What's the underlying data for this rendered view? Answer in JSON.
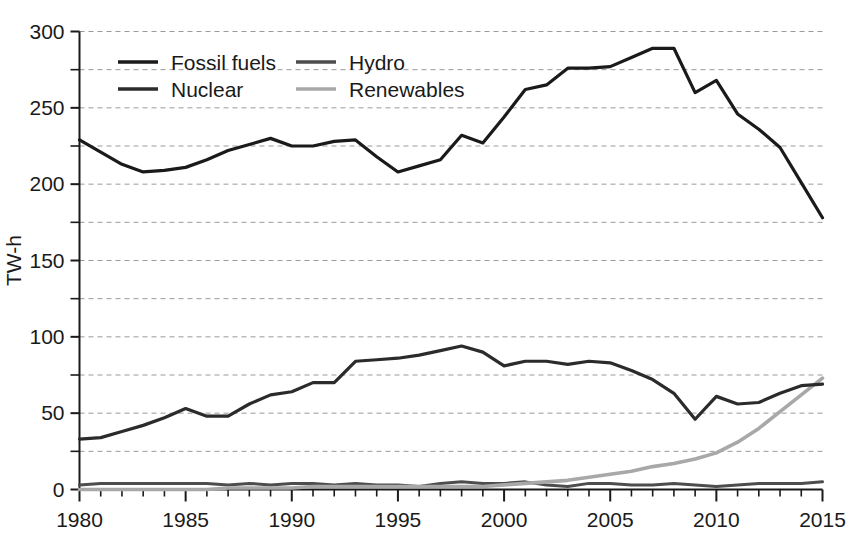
{
  "chart_data": {
    "type": "line",
    "title": "",
    "subtitle": "",
    "xlabel": "",
    "ylabel": "TW-h",
    "xlim": [
      1980,
      2015
    ],
    "ylim": [
      0,
      300
    ],
    "grid": true,
    "grid_axis": "y",
    "grid_style": "dashed",
    "legend_position": "top-left inside",
    "y_ticks_major": [
      0,
      50,
      100,
      150,
      200,
      250,
      300
    ],
    "y_tick_labels": [
      "0",
      "50",
      "100",
      "150",
      "200",
      "250",
      "300"
    ],
    "y_ticks_minor": [
      25,
      75,
      125,
      175,
      225,
      275
    ],
    "x_ticks_major": [
      1980,
      1985,
      1990,
      1995,
      2000,
      2005,
      2010,
      2015
    ],
    "x_tick_labels": [
      "1980",
      "1985",
      "1990",
      "1995",
      "2000",
      "2005",
      "2010",
      "2015"
    ],
    "x_tick_minor_step": 1,
    "x": [
      1980,
      1981,
      1982,
      1983,
      1984,
      1985,
      1986,
      1987,
      1988,
      1989,
      1990,
      1991,
      1992,
      1993,
      1994,
      1995,
      1996,
      1997,
      1998,
      1999,
      2000,
      2001,
      2002,
      2003,
      2004,
      2005,
      2006,
      2007,
      2008,
      2009,
      2010,
      2011,
      2012,
      2013,
      2014,
      2015
    ],
    "series": [
      {
        "name": "Fossil fuels",
        "color": "#1a1a1a",
        "width": 3.2,
        "values": [
          229,
          221,
          213,
          208,
          209,
          211,
          216,
          222,
          226,
          230,
          225,
          225,
          228,
          229,
          218,
          208,
          212,
          216,
          232,
          227,
          244,
          262,
          265,
          276,
          276,
          277,
          283,
          289,
          289,
          260,
          268,
          246,
          236,
          224,
          201,
          178
        ]
      },
      {
        "name": "Nuclear",
        "color": "#2b2b2b",
        "width": 3.2,
        "values": [
          33,
          34,
          38,
          42,
          47,
          53,
          48,
          48,
          56,
          62,
          64,
          70,
          70,
          84,
          85,
          86,
          88,
          91,
          94,
          90,
          81,
          84,
          84,
          82,
          84,
          83,
          78,
          72,
          63,
          46,
          61,
          56,
          57,
          63,
          68,
          69
        ]
      },
      {
        "name": "Hydro",
        "color": "#4d4d4d",
        "width": 3.0,
        "values": [
          3,
          4,
          4,
          4,
          4,
          4,
          4,
          3,
          4,
          3,
          4,
          4,
          3,
          4,
          3,
          3,
          2,
          4,
          5,
          4,
          4,
          5,
          3,
          2,
          4,
          4,
          3,
          3,
          4,
          3,
          2,
          3,
          4,
          4,
          4,
          5
        ]
      },
      {
        "name": "Renewables",
        "color": "#a8a8a8",
        "width": 3.6,
        "values": [
          0,
          0,
          0,
          0,
          0,
          0,
          0,
          1,
          1,
          1,
          1,
          2,
          2,
          2,
          2,
          2,
          2,
          2,
          2,
          2,
          3,
          4,
          5,
          6,
          8,
          10,
          12,
          15,
          17,
          20,
          24,
          31,
          40,
          51,
          62,
          73
        ]
      }
    ],
    "legend": [
      {
        "label": "Fossil fuels",
        "color": "#1a1a1a"
      },
      {
        "label": "Hydro",
        "color": "#4d4d4d"
      },
      {
        "label": "Nuclear",
        "color": "#2b2b2b"
      },
      {
        "label": "Renewables",
        "color": "#a8a8a8"
      }
    ]
  }
}
